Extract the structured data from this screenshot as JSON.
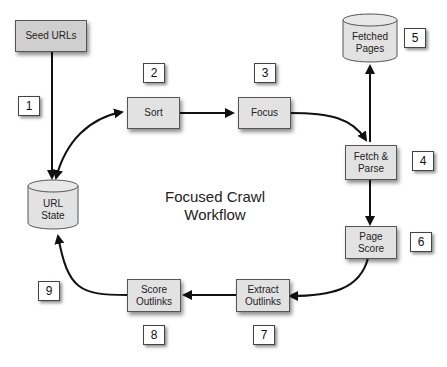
{
  "diagram": {
    "title_line1": "Focused Crawl",
    "title_line2": "Workflow",
    "nodes": {
      "seed_urls": {
        "label": "Seed URLs"
      },
      "sort": {
        "label": "Sort"
      },
      "focus": {
        "label": "Focus"
      },
      "fetch_parse": {
        "line1": "Fetch &",
        "line2": "Parse"
      },
      "page_score": {
        "line1": "Page",
        "line2": "Score"
      },
      "extract_outlinks": {
        "line1": "Extract",
        "line2": "Outlinks"
      },
      "score_outlinks": {
        "line1": "Score",
        "line2": "Outlinks"
      }
    },
    "stores": {
      "url_state": {
        "line1": "URL",
        "line2": "State"
      },
      "fetched_pages": {
        "line1": "Fetched",
        "line2": "Pages"
      }
    },
    "steps": [
      "1",
      "2",
      "3",
      "4",
      "5",
      "6",
      "7",
      "8",
      "9"
    ],
    "edges": [
      {
        "from": "Seed URLs",
        "to": "URL State",
        "step": "1"
      },
      {
        "from": "URL State",
        "to": "Sort",
        "bidirectional": true
      },
      {
        "from": "Sort",
        "to": "Focus"
      },
      {
        "from": "Focus",
        "to": "Fetch & Parse"
      },
      {
        "from": "Fetch & Parse",
        "to": "Fetched Pages"
      },
      {
        "from": "Fetch & Parse",
        "to": "Page Score"
      },
      {
        "from": "Page Score",
        "to": "Extract Outlinks"
      },
      {
        "from": "Extract Outlinks",
        "to": "Score Outlinks"
      },
      {
        "from": "Score Outlinks",
        "to": "URL State"
      }
    ],
    "colors": {
      "node_fill": "#e2e2e2",
      "seed_fill": "#cfcfcf",
      "stroke": "#111111",
      "badge_fill": "#ffffff"
    }
  }
}
